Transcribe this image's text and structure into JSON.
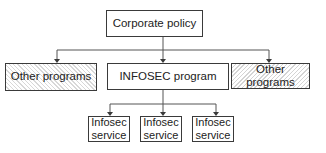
{
  "diagram": {
    "root": {
      "label": "Corporate policy"
    },
    "level1": [
      {
        "label": "Other programs",
        "style": "hatched"
      },
      {
        "label": "INFOSEC program",
        "style": "plain"
      },
      {
        "label": "Other programs",
        "style": "hatched"
      }
    ],
    "level2": [
      {
        "line1": "Infosec",
        "line2": "service"
      },
      {
        "line1": "Infosec",
        "line2": "service"
      },
      {
        "line1": "Infosec",
        "line2": "service"
      }
    ],
    "colors": {
      "line": "#3a3a3a",
      "hatch": "#d6d6d6",
      "background": "#ffffff"
    }
  }
}
